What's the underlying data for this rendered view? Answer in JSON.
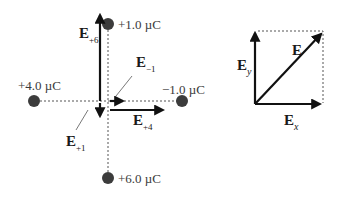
{
  "charges": {
    "top": {
      "label": "+1.0 µC"
    },
    "left": {
      "label": "+4.0 µC"
    },
    "right": {
      "label": "−1.0 µC"
    },
    "bottom": {
      "label": "+6.0 µC"
    }
  },
  "field_vectors": {
    "e_plus6": {
      "symbol": "E",
      "subscript": "+6"
    },
    "e_minus1": {
      "symbol": "E",
      "subscript": "−1"
    },
    "e_plus4": {
      "symbol": "E",
      "subscript": "+4"
    },
    "e_plus1": {
      "symbol": "E",
      "subscript": "+1"
    }
  },
  "components": {
    "resultant": {
      "symbol": "E"
    },
    "y_component": {
      "symbol": "E",
      "subscript": "y"
    },
    "x_component": {
      "symbol": "E",
      "subscript": "x"
    }
  },
  "colors": {
    "charge_fill": "#3c3c3c",
    "arrow": "#111111",
    "dashed": "#555555"
  }
}
